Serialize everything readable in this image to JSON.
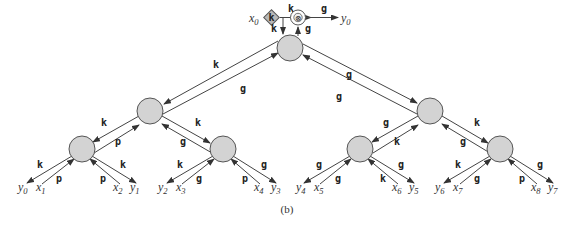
{
  "figure": {
    "caption": "(b)",
    "node_fill": "#d3d3d3",
    "edge_color": "#444444",
    "top": {
      "input": {
        "var": "x",
        "sub": "0"
      },
      "diamond_label": "k",
      "operator_symbol": "⊗",
      "output": {
        "var": "y",
        "sub": "0"
      },
      "edge_in_label": "k",
      "edge_out_label": "g",
      "down_label": "k",
      "up_label": "g"
    },
    "root_edges": {
      "left_down": "k",
      "left_up": "g",
      "right_down": "g",
      "right_up": "g"
    },
    "level1": [
      {
        "id": "L",
        "to_left": "k",
        "from_left": "p",
        "to_right": "k",
        "from_right": "g"
      },
      {
        "id": "R",
        "to_left": "g",
        "from_left": "k",
        "to_right": "k",
        "from_right": "g"
      }
    ],
    "level2": [
      {
        "out_left": "k",
        "in_left": "p",
        "in_right": "p",
        "out_right": "k"
      },
      {
        "out_left": "k",
        "in_left": "g",
        "in_right": "p",
        "out_right": "g"
      },
      {
        "out_left": "g",
        "in_left": "g",
        "in_right": "k",
        "out_right": "g"
      },
      {
        "out_left": "k",
        "in_left": "g",
        "in_right": "p",
        "out_right": "g"
      }
    ],
    "leaves": [
      {
        "var": "y",
        "sub": "0"
      },
      {
        "var": "x",
        "sub": "1"
      },
      {
        "var": "x",
        "sub": "2"
      },
      {
        "var": "y",
        "sub": "1"
      },
      {
        "var": "y",
        "sub": "2"
      },
      {
        "var": "x",
        "sub": "3"
      },
      {
        "var": "x",
        "sub": "4"
      },
      {
        "var": "y",
        "sub": "3"
      },
      {
        "var": "y",
        "sub": "4"
      },
      {
        "var": "x",
        "sub": "5"
      },
      {
        "var": "x",
        "sub": "6"
      },
      {
        "var": "y",
        "sub": "5"
      },
      {
        "var": "y",
        "sub": "6"
      },
      {
        "var": "x",
        "sub": "7"
      },
      {
        "var": "x",
        "sub": "8"
      },
      {
        "var": "y",
        "sub": "7"
      }
    ]
  }
}
